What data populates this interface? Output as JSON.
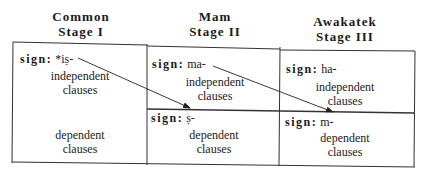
{
  "columns": [
    {
      "language": "Common",
      "stage": "Stage  I",
      "sign_label": "sign:",
      "sign_morpheme": "*iṣ-",
      "clauses": [
        {
          "line1": "independent",
          "line2": "clauses"
        },
        {
          "line1": "dependent",
          "line2": "clauses"
        }
      ]
    },
    {
      "language": "Mam",
      "stage": "Stage  II",
      "sign_label": "sign:",
      "sign_morpheme": "ma-",
      "lower_sign_label": "sign:",
      "lower_sign_morpheme": "ṣ-",
      "clauses": [
        {
          "line1": "independent",
          "line2": "clauses"
        },
        {
          "line1": "dependent",
          "line2": "clauses"
        }
      ]
    },
    {
      "language": "Awakatek",
      "stage": "Stage  III",
      "sign_label": "sign:",
      "sign_morpheme": "ha-",
      "lower_sign_label": "sign:",
      "lower_sign_morpheme": "m-",
      "clauses": [
        {
          "line1": "independent",
          "line2": "clauses"
        },
        {
          "line1": "dependent",
          "line2": "clauses"
        }
      ]
    }
  ],
  "arrows": [
    {
      "from": "Stage I *iṣ-",
      "to": "Stage II ṣ-"
    },
    {
      "from": "Stage II ma-",
      "to": "Stage III m-"
    }
  ],
  "colors": {
    "line": "#333333",
    "text": "#1a1a1a",
    "background": "#ffffff"
  }
}
